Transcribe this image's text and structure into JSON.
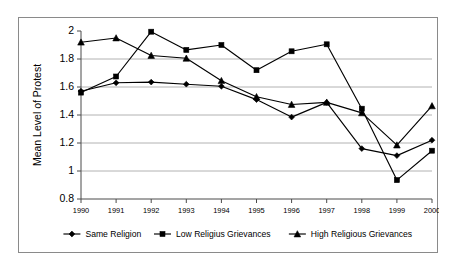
{
  "figure": {
    "border_color": "#8a8a8a",
    "background": "#ffffff"
  },
  "chart_data": {
    "type": "line",
    "title": "",
    "subtitle": "",
    "xlabel": "",
    "ylabel": "Mean Level of Protest",
    "x": [
      1990,
      1991,
      1992,
      1993,
      1994,
      1995,
      1996,
      1997,
      1998,
      1999,
      2000
    ],
    "categories": [
      "1990",
      "1991",
      "1992",
      "1993",
      "1994",
      "1995",
      "1996",
      "1997",
      "1998",
      "1999",
      "2000"
    ],
    "ylim": [
      0.8,
      2.0
    ],
    "yticks": [
      0.8,
      1,
      1.2,
      1.4,
      1.6,
      1.8,
      2
    ],
    "ytick_labels": [
      "0.8",
      "1",
      "1.2",
      "1.4",
      "1.6",
      "1.8",
      "2"
    ],
    "grid": "horizontal",
    "legend_position": "bottom",
    "series": [
      {
        "name": "Same Religion",
        "marker": "diamond",
        "color": "#000000",
        "values": [
          1.57,
          1.63,
          1.635,
          1.62,
          1.605,
          1.51,
          1.385,
          1.49,
          1.16,
          1.11,
          1.22
        ]
      },
      {
        "name": "Low Religius Grievances",
        "marker": "square",
        "color": "#000000",
        "values": [
          1.56,
          1.675,
          1.995,
          1.865,
          1.9,
          1.72,
          1.855,
          1.905,
          1.445,
          0.935,
          1.145
        ]
      },
      {
        "name": "High Religious Grievances",
        "marker": "triangle",
        "color": "#000000",
        "values": [
          1.92,
          1.95,
          1.825,
          1.805,
          1.645,
          1.53,
          1.475,
          1.49,
          1.415,
          1.185,
          1.465
        ]
      }
    ]
  }
}
